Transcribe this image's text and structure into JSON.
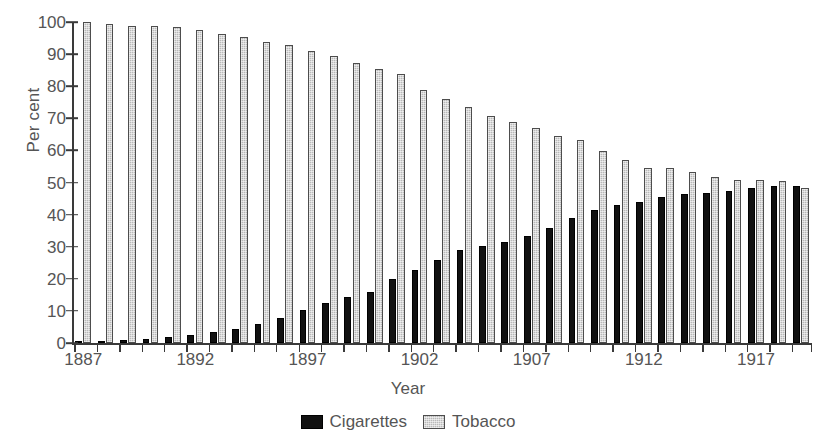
{
  "chart_data": {
    "type": "bar",
    "title": "",
    "xlabel": "Year",
    "ylabel": "Per cent",
    "ylim": [
      0,
      100
    ],
    "yticks": [
      0,
      10,
      20,
      30,
      40,
      50,
      60,
      70,
      80,
      90,
      100
    ],
    "xtick_labels": [
      "1887",
      "1892",
      "1897",
      "1902",
      "1907",
      "1912",
      "1917"
    ],
    "xtick_years": [
      1887,
      1892,
      1897,
      1902,
      1907,
      1912,
      1917
    ],
    "grid": false,
    "legend_position": "bottom-center",
    "categories": [
      "1887",
      "1888",
      "1889",
      "1890",
      "1891",
      "1892",
      "1893",
      "1894",
      "1895",
      "1896",
      "1897",
      "1898",
      "1899",
      "1900",
      "1901",
      "1902",
      "1903",
      "1904",
      "1905",
      "1906",
      "1907",
      "1908",
      "1909",
      "1910",
      "1911",
      "1912",
      "1913",
      "1914",
      "1915",
      "1916",
      "1917",
      "1918",
      "1919"
    ],
    "series": [
      {
        "name": "Cigarettes",
        "color": "#111111",
        "values": [
          0,
          0.5,
          1,
          1.5,
          2,
          2.5,
          3.5,
          4.5,
          6,
          8,
          10.5,
          12.5,
          14.5,
          16,
          20,
          23,
          26,
          29,
          30.5,
          31.5,
          33.5,
          36,
          39,
          41.5,
          43,
          44,
          45.5,
          46.5,
          47,
          47.5,
          48.5,
          49,
          49
        ]
      },
      {
        "name": "Tobacco",
        "color": "#b9b9b9",
        "values": [
          100,
          99.5,
          99,
          99,
          98.5,
          97.5,
          96.5,
          95.5,
          94,
          93,
          91,
          89.5,
          87.5,
          85.5,
          84,
          79,
          76,
          73.5,
          71,
          69,
          67,
          64.5,
          63.5,
          60,
          57,
          54.5,
          54.5,
          53.5,
          52,
          51,
          51,
          50.5,
          48.5
        ]
      }
    ]
  },
  "legend": {
    "items": [
      {
        "label": "Cigarettes",
        "swatch": "black-square-swatch"
      },
      {
        "label": "Tobacco",
        "swatch": "gray-square-swatch"
      }
    ]
  },
  "axes": {
    "y_title": "Per cent",
    "x_title": "Year"
  }
}
